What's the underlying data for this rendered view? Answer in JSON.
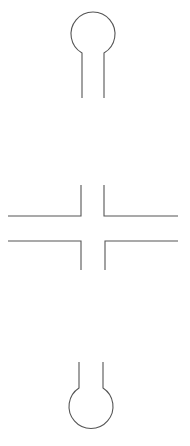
{
  "diagram": {
    "title": "",
    "top_hairpin": {
      "rows": [
        {
          "left": "",
          "pair": "+",
          "right": ""
        },
        {
          "left": "",
          "pair": "+",
          "right": ""
        },
        {
          "left": "A",
          "pair": "+",
          "right": "A"
        },
        {
          "left": "A",
          "pair": "+",
          "right": "A"
        },
        {
          "left": "C",
          "pair": "+",
          "right": "C"
        },
        {
          "left": "C",
          "pair": "+",
          "right": "C"
        },
        {
          "left": "C",
          "pair": "+",
          "right": "C"
        },
        {
          "left": "C",
          "pair": "+",
          "right": "C"
        },
        {
          "left": "",
          "pair": "+",
          "right": ""
        }
      ]
    },
    "bottom_hairpin": {
      "rows": [
        {
          "left": "G",
          "pair": "",
          "right": "G"
        },
        {
          "left": "G",
          "pair": "",
          "right": "G"
        },
        {
          "left": "G",
          "pair": "",
          "right": "G"
        },
        {
          "left": "G",
          "pair": "",
          "right": "G"
        },
        {
          "left": "T",
          "pair": "",
          "right": "T"
        },
        {
          "left": "T",
          "pair": "",
          "right": "T"
        }
      ]
    },
    "duplex_arms": {
      "left_dots": "· · · ·",
      "right_dots": "· · · ·",
      "left_dot_count": 4,
      "right_dot_count": 4
    },
    "colors": {
      "line": "#555555",
      "text": "#444444",
      "background": "#ffffff"
    }
  }
}
